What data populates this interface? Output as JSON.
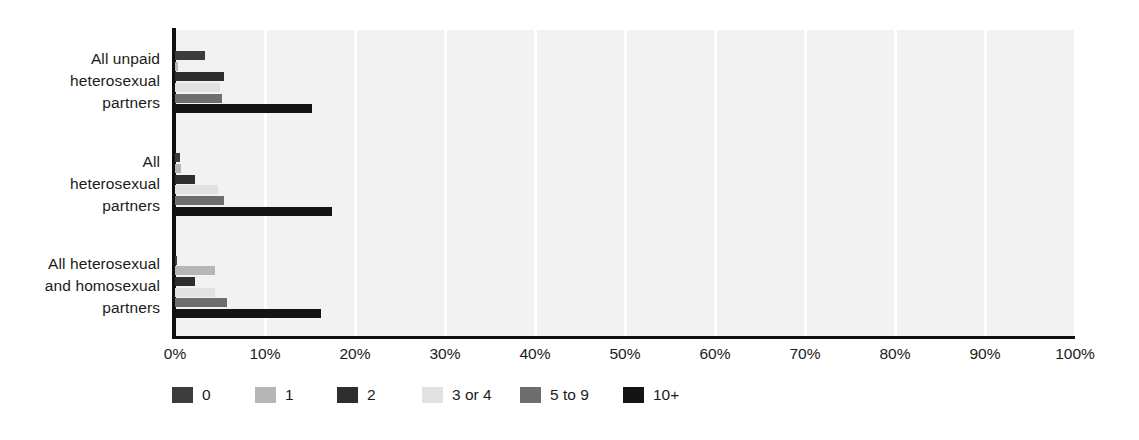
{
  "chart_data": {
    "type": "bar",
    "orientation": "horizontal",
    "title": "",
    "subtitle": "",
    "xlabel": "",
    "ylabel": "",
    "xlim": [
      0,
      100
    ],
    "xtick_labels": [
      "0%",
      "10%",
      "20%",
      "30%",
      "40%",
      "50%",
      "60%",
      "70%",
      "80%",
      "90%",
      "100%"
    ],
    "xtick_values": [
      0,
      10,
      20,
      30,
      40,
      50,
      60,
      70,
      80,
      90,
      100
    ],
    "grid": "vertical-white-gridlines",
    "legend_position": "bottom-left",
    "categories": [
      "All unpaid heterosexual partners",
      "All heterosexual partners",
      "All heterosexual and homosexual partners"
    ],
    "category_label_lines": [
      [
        "All unpaid",
        "heterosexual",
        "partners"
      ],
      [
        "All",
        "heterosexual",
        "partners"
      ],
      [
        "All heterosexual",
        "and homosexual",
        "partners"
      ]
    ],
    "series": [
      {
        "name": "0",
        "color": "#3c3c3c",
        "values": [
          3.3,
          0.5,
          0.2
        ]
      },
      {
        "name": "1",
        "color": "#b6b6b6",
        "values": [
          0.3,
          0.7,
          4.4
        ]
      },
      {
        "name": "2",
        "color": "#2e2e2e",
        "values": [
          5.4,
          2.2,
          2.2
        ]
      },
      {
        "name": "3 or 4",
        "color": "#e2e2e2",
        "values": [
          5.0,
          4.8,
          4.4
        ]
      },
      {
        "name": "5 to 9",
        "color": "#6e6e6e",
        "values": [
          5.2,
          5.4,
          5.8
        ]
      },
      {
        "name": "10+",
        "color": "#141414",
        "values": [
          15.2,
          17.4,
          16.2
        ]
      }
    ]
  },
  "legend": {
    "entries": [
      {
        "label": "0",
        "color": "#3c3c3c"
      },
      {
        "label": "1",
        "color": "#b6b6b6"
      },
      {
        "label": "2",
        "color": "#2e2e2e"
      },
      {
        "label": "3 or 4",
        "color": "#e2e2e2"
      },
      {
        "label": "5 to 9",
        "color": "#6e6e6e"
      },
      {
        "label": "10+",
        "color": "#141414"
      }
    ]
  },
  "colors": {
    "plot_background": "#f2f2f2",
    "gridline": "#ffffff",
    "axis": "#101010",
    "text": "#1b1b1b"
  }
}
